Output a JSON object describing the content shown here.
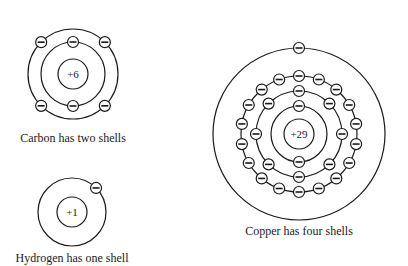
{
  "atoms": [
    {
      "name": "carbon",
      "nucleus_label": "+6",
      "caption": "Carbon has two shells",
      "center": [
        73,
        74
      ],
      "nucleus_r": 15,
      "shells": [
        {
          "r": 32,
          "electrons": 2,
          "angles": [
            90,
            270
          ]
        },
        {
          "r": 45,
          "electrons": 4,
          "angles": [
            135,
            45,
            225,
            315
          ]
        }
      ]
    },
    {
      "name": "hydrogen",
      "nucleus_label": "+1",
      "caption": "Hydrogen has one shell",
      "center": [
        72,
        212
      ],
      "nucleus_r": 15,
      "shells": [
        {
          "r": 34,
          "electrons": 1,
          "angles": [
            45
          ]
        }
      ]
    },
    {
      "name": "copper",
      "nucleus_label": "+29",
      "caption": "Copper has four shells",
      "center": [
        299,
        134
      ],
      "nucleus_r": 15,
      "shells": [
        {
          "r": 28,
          "electrons": 2
        },
        {
          "r": 43,
          "electrons": 8
        },
        {
          "r": 58,
          "electrons": 18
        },
        {
          "r": 86,
          "electrons": 1,
          "angles": [
            90
          ]
        }
      ]
    }
  ]
}
